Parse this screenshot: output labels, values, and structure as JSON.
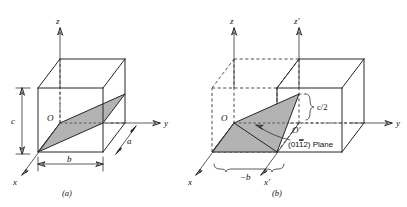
{
  "figure": {
    "background": "#ffffff",
    "ink": "#262626",
    "plane_fill": "#b3b3b3",
    "panels": [
      {
        "id": "a",
        "caption": "(a)",
        "origin_label": "O",
        "axes": [
          {
            "name": "z-axis",
            "label": "z"
          },
          {
            "name": "y-axis",
            "label": "y"
          },
          {
            "name": "x-axis",
            "label": "x"
          }
        ],
        "dimensions": [
          {
            "name": "edge-c",
            "label": "c"
          },
          {
            "name": "edge-b",
            "label": "b"
          },
          {
            "name": "edge-a",
            "label": "a"
          }
        ]
      },
      {
        "id": "b",
        "caption": "(b)",
        "origin_label": "O",
        "origin_prime_label": "O′",
        "axes": [
          {
            "name": "z-axis",
            "label": "z"
          },
          {
            "name": "z-prime-axis",
            "label": "z′"
          },
          {
            "name": "y-axis",
            "label": "y"
          },
          {
            "name": "x-axis",
            "label": "x"
          },
          {
            "name": "x-prime-axis",
            "label": "x′"
          }
        ],
        "dimensions": [
          {
            "name": "intercept-c-half",
            "label": "c/2"
          },
          {
            "name": "intercept-minus-b",
            "label": "−b"
          }
        ],
        "annotation": {
          "name": "plane-callout",
          "prefix": "(01",
          "bar_digit": "1",
          "suffix": "2) Plane",
          "full": "(01̅2) Plane"
        }
      }
    ]
  }
}
